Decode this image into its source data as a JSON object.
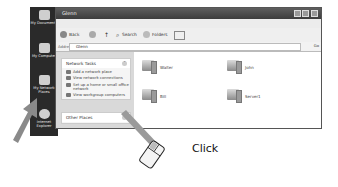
{
  "desktop": {
    "icons": [
      {
        "label": "My Documents",
        "icon": "folder-icon"
      },
      {
        "label": "My Computer",
        "icon": "computer-icon"
      },
      {
        "label": "My Network Places",
        "icon": "network-icon"
      },
      {
        "label": "Internet Explorer",
        "icon": "browser-icon"
      }
    ]
  },
  "window": {
    "title": "Glenn",
    "menu": [
      "File",
      "Edit",
      "View",
      "Favorites",
      "Tools",
      "Help"
    ],
    "toolbar": {
      "back_label": "Back",
      "search_label": "Search",
      "folders_label": "Folders"
    },
    "address": {
      "label": "Address",
      "value": "Glenn",
      "go_label": "Go"
    },
    "task_pane": {
      "network_tasks": {
        "title": "Network Tasks",
        "items": [
          "Add a network place",
          "View network connections",
          "Set up a home or small office network",
          "View workgroup computers"
        ]
      },
      "other_places": {
        "title": "Other Places"
      }
    },
    "computers": [
      "Walter",
      "John",
      "Bill",
      "Server1"
    ]
  },
  "annotation": {
    "click_label": "Click"
  }
}
